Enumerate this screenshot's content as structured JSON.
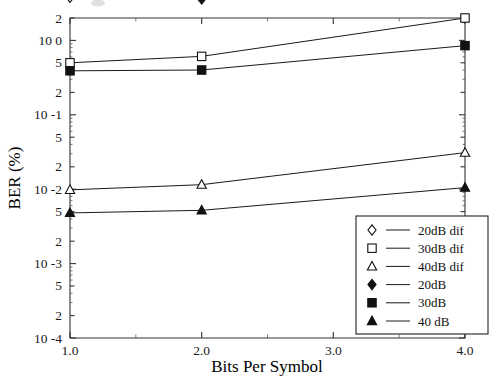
{
  "chart_data": {
    "type": "line",
    "title": "",
    "xlabel": "Bits Per Symbol",
    "ylabel": "BER (%)",
    "xscale": "linear",
    "yscale": "log",
    "xlim": [
      1.0,
      4.0
    ],
    "ylim": [
      0.0001,
      2.0
    ],
    "grid": false,
    "legend_position": "lower-right",
    "x_tick_labels": [
      "1.0",
      "2.0",
      "3.0",
      "4.0"
    ],
    "x_ticks": [
      1.0,
      2.0,
      3.0,
      4.0
    ],
    "y_tick_labels": [
      "2",
      "10 0",
      "5",
      "2",
      "10 -1",
      "5",
      "2",
      "10 -2",
      "5",
      "2",
      "10 -3",
      "5",
      "2",
      "10 -4"
    ],
    "y_ticks": [
      2,
      1,
      0.5,
      0.2,
      0.1,
      0.05,
      0.02,
      0.01,
      0.005,
      0.002,
      0.001,
      0.0005,
      0.0002,
      0.0001
    ],
    "x": [
      1.0,
      2.0,
      4.0
    ],
    "series": [
      {
        "name": "20dB dif",
        "marker": "open-diamond",
        "values": [
          3.8,
          4.3,
          12.0
        ]
      },
      {
        "name": "30dB dif",
        "marker": "open-square",
        "values": [
          0.5,
          0.61,
          2.0
        ]
      },
      {
        "name": "40dB dif",
        "marker": "open-triangle",
        "values": [
          0.0098,
          0.0115,
          0.031
        ]
      },
      {
        "name": "20dB",
        "marker": "filled-diamond",
        "values": [
          4.5,
          3.6,
          7.0
        ]
      },
      {
        "name": "30dB",
        "marker": "filled-square",
        "values": [
          0.39,
          0.4,
          0.85
        ]
      },
      {
        "name": "40 dB",
        "marker": "filled-triangle",
        "values": [
          0.0048,
          0.0052,
          0.0105
        ]
      }
    ]
  },
  "legend": {
    "entries": [
      {
        "label": "20dB dif",
        "marker": "open-diamond"
      },
      {
        "label": "30dB dif",
        "marker": "open-square"
      },
      {
        "label": "40dB dif",
        "marker": "open-triangle"
      },
      {
        "label": "20dB",
        "marker": "filled-diamond"
      },
      {
        "label": "30dB",
        "marker": "filled-square"
      },
      {
        "label": "40 dB",
        "marker": "filled-triangle"
      }
    ]
  },
  "colors": {
    "axis": "#333333",
    "line": "#1a1a1a",
    "marker_fill_open": "#ffffff",
    "marker_fill_closed": "#111111",
    "background": "#ffffff"
  }
}
